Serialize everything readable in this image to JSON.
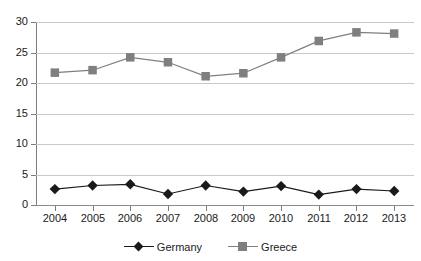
{
  "chart_data": {
    "type": "line",
    "title": "",
    "subtitle": "",
    "xlabel": "",
    "ylabel": "",
    "categories": [
      "2004",
      "2005",
      "2006",
      "2007",
      "2008",
      "2009",
      "2010",
      "2011",
      "2012",
      "2013"
    ],
    "series": [
      {
        "name": "Germany",
        "color": "#1a1a1a",
        "marker": "diamond",
        "values": [
          2.6,
          3.2,
          3.4,
          1.8,
          3.2,
          2.2,
          3.1,
          1.7,
          2.6,
          2.3
        ]
      },
      {
        "name": "Greece",
        "color": "#7f7f7f",
        "marker": "square",
        "values": [
          21.7,
          22.1,
          24.2,
          23.4,
          21.1,
          21.6,
          24.2,
          26.9,
          28.3,
          28.1
        ]
      }
    ],
    "ylim": [
      0,
      30
    ],
    "yticks": [
      0,
      5,
      10,
      15,
      20,
      25,
      30
    ],
    "ytick_labels": [
      "0",
      "5",
      "10",
      "15",
      "20",
      "25",
      "30"
    ],
    "grid": true,
    "grid_axis": "y",
    "legend_position": "bottom"
  },
  "legend": {
    "entries": [
      {
        "label": "Germany",
        "marker_name": "legend-marker-diamond"
      },
      {
        "label": "Greece",
        "marker_name": "legend-marker-square"
      }
    ]
  },
  "colors": {
    "germany": "#1a1a1a",
    "greece": "#7f7f7f",
    "gridline": "#c9c9c9",
    "axis": "#7d7d7d",
    "background": "#ffffff"
  }
}
